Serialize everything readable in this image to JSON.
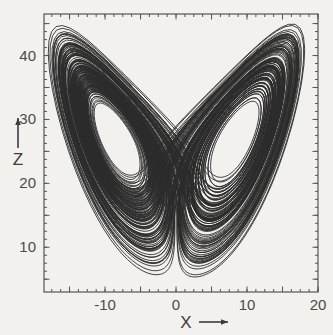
{
  "figure": {
    "background_color": "#f2f1ee",
    "ink_color": "#2b2b2b",
    "frame_color": "#555555",
    "caption_visible": false
  },
  "chart_data": {
    "type": "line",
    "title": "",
    "subtitle": "",
    "xlabel": "X",
    "ylabel": "Z",
    "xlabel_arrow": "→",
    "ylabel_arrow": "↑",
    "xlim": [
      -18.6,
      20.0
    ],
    "ylim": [
      3.0,
      46.5
    ],
    "xticks": [
      -20,
      -15,
      -10,
      -5,
      0,
      5,
      10,
      15,
      20
    ],
    "xtick_labels": [
      "",
      "",
      "-10",
      "",
      "0",
      "",
      "10",
      "",
      "20"
    ],
    "labeled_xticks": [
      {
        "value": -10,
        "label": "-10"
      },
      {
        "value": 0,
        "label": "0"
      },
      {
        "value": 10,
        "label": "10"
      },
      {
        "value": 20,
        "label": "20"
      }
    ],
    "yticks": [
      5,
      10,
      15,
      20,
      25,
      30,
      35,
      40,
      45
    ],
    "ytick_labels": [
      "",
      "10",
      "",
      "20",
      "",
      "30",
      "",
      "40",
      ""
    ],
    "labeled_yticks": [
      {
        "value": 10,
        "label": "10"
      },
      {
        "value": 20,
        "label": "20"
      },
      {
        "value": 30,
        "label": "30"
      },
      {
        "value": 40,
        "label": "40"
      }
    ],
    "minor_tick_step_x": 1.25,
    "minor_tick_step_y": 1.25,
    "grid": false,
    "legend": null,
    "legend_position": "none",
    "ticks_direction": "in",
    "ticks_on_all_sides": true,
    "series": [
      {
        "name": "Lorenz attractor trajectory (X vs Z)",
        "description": "Chaotic orbit of the Lorenz system projected on the X-Z plane; two lobes (wings) centered near X = -8.5, Z = 27 and X = +8.5, Z = 27.",
        "system": "Lorenz equations",
        "parameters": {
          "sigma": 10,
          "rho": 28,
          "beta": 2.667
        },
        "fixed_points": [
          {
            "x": -8.49,
            "z": 27
          },
          {
            "x": 8.49,
            "z": 27
          }
        ],
        "line_color": "#2b2b2b",
        "line_width": 0.9,
        "n_loops_left_lobe": 14,
        "n_loops_right_lobe": 13,
        "x_range_observed": [
          -17.5,
          18.5
        ],
        "z_range_observed": [
          4.5,
          45.0
        ]
      }
    ]
  }
}
